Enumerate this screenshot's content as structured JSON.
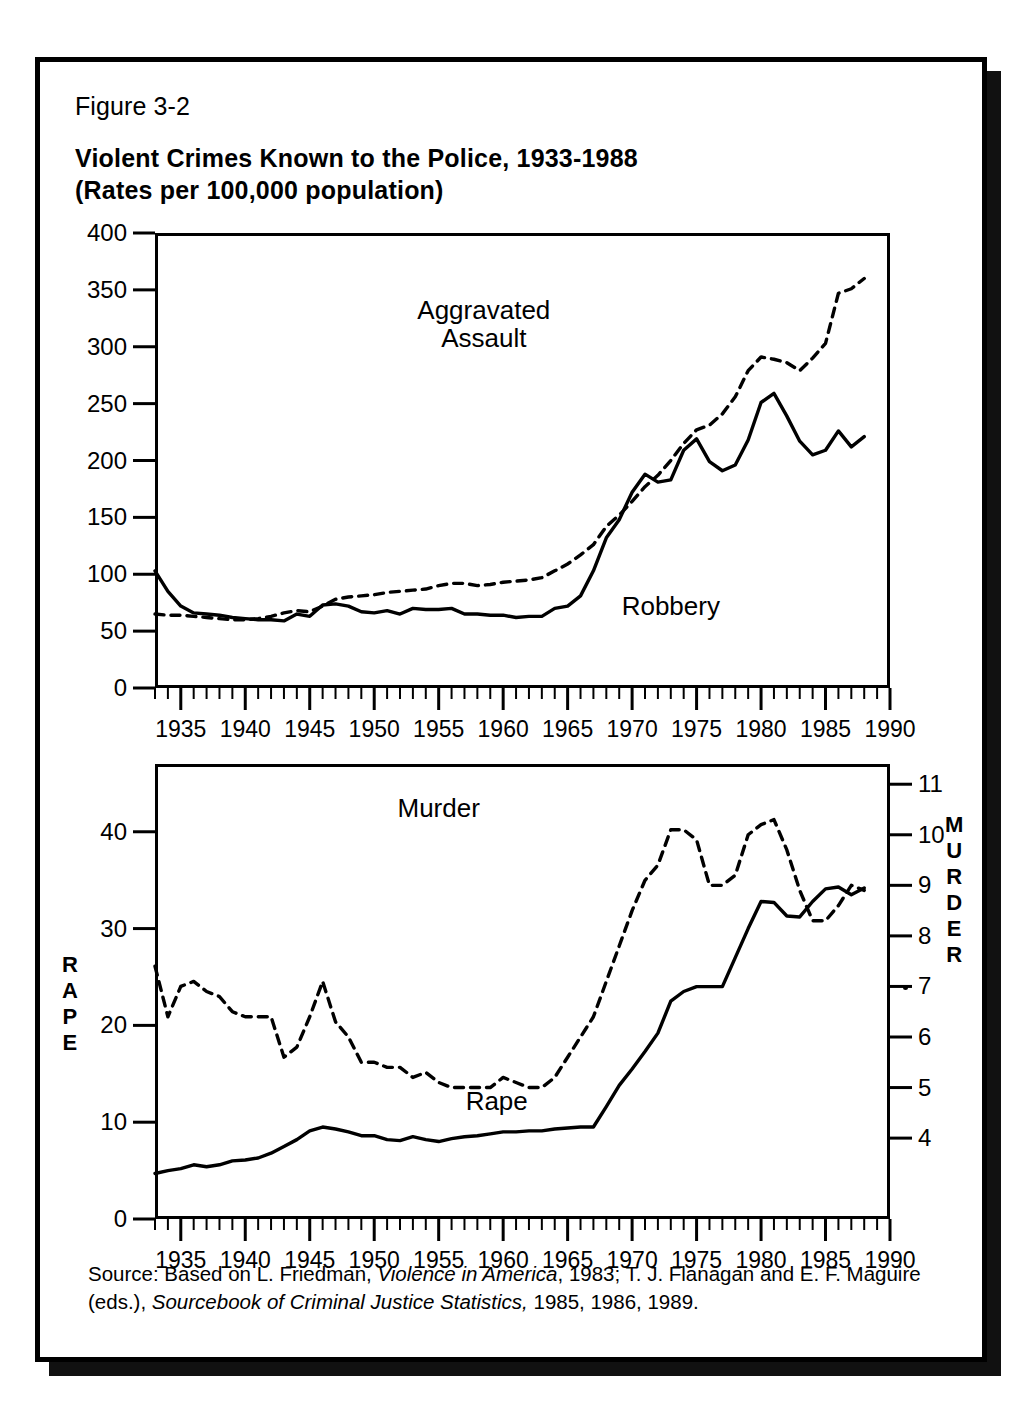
{
  "figure": {
    "number": "Figure 3-2",
    "title_line1": "Violent Crimes Known to the Police, 1933-1988",
    "title_line2": "(Rates per 100,000 population)",
    "source_prefix": "Source: Based on L. Friedman, ",
    "source_italic1": "Violence in America",
    "source_mid": ", 1983; T. J. Flanagan and E. F. Maguire (eds.), ",
    "source_italic2": "Sourcebook of Criminal Justice Statistics,",
    "source_suffix": " 1985, 1986, 1989."
  },
  "colors": {
    "ink": "#000000",
    "paper": "#ffffff",
    "shadow": "#111111"
  },
  "chart_data": [
    {
      "type": "line",
      "id": "upper",
      "title": "Violent Crimes Known to the Police, 1933-1988",
      "xlabel": "",
      "ylabel": "",
      "xlim": [
        1933,
        1990
      ],
      "ylim": [
        0,
        400
      ],
      "grid": false,
      "legend_position": "in-plot annotations",
      "yticks": [
        0,
        50,
        100,
        150,
        200,
        250,
        300,
        350,
        400
      ],
      "ytick_labels": [
        "0",
        "50",
        "100",
        "150",
        "200",
        "250",
        "300",
        "350",
        "400"
      ],
      "xticks": [
        1935,
        1940,
        1945,
        1950,
        1955,
        1960,
        1965,
        1970,
        1975,
        1980,
        1985,
        1990
      ],
      "xtick_labels": [
        "1935",
        "1940",
        "1945",
        "1950",
        "1955",
        "1960",
        "1965",
        "1970",
        "1975",
        "1980",
        "1985",
        "1990"
      ],
      "minor_xtick_step": 1,
      "annotations": [
        {
          "text": "Aggravated",
          "x": 1958.5,
          "y": 332
        },
        {
          "text": "Assault",
          "x": 1958.5,
          "y": 308
        },
        {
          "text": "Robbery",
          "x": 1973.0,
          "y": 72
        }
      ],
      "x": [
        1933,
        1934,
        1935,
        1936,
        1937,
        1938,
        1939,
        1940,
        1941,
        1942,
        1943,
        1944,
        1945,
        1946,
        1947,
        1948,
        1949,
        1950,
        1951,
        1952,
        1953,
        1954,
        1955,
        1956,
        1957,
        1958,
        1959,
        1960,
        1961,
        1962,
        1963,
        1964,
        1965,
        1966,
        1967,
        1968,
        1969,
        1970,
        1971,
        1972,
        1973,
        1974,
        1975,
        1976,
        1977,
        1978,
        1979,
        1980,
        1981,
        1982,
        1983,
        1984,
        1985,
        1986,
        1987,
        1988
      ],
      "series": [
        {
          "name": "Aggravated Assault",
          "style": "dashed",
          "values": [
            65,
            64,
            64,
            63,
            62,
            61,
            60,
            60,
            61,
            63,
            66,
            68,
            67,
            72,
            78,
            80,
            81,
            82,
            84,
            85,
            86,
            87,
            90,
            92,
            92,
            90,
            91,
            93,
            94,
            95,
            97,
            103,
            109,
            117,
            126,
            142,
            152,
            164,
            177,
            187,
            200,
            215,
            227,
            231,
            241,
            256,
            279,
            291,
            289,
            286,
            279,
            290,
            303,
            347,
            351,
            360
          ]
        },
        {
          "name": "Robbery",
          "style": "solid",
          "values": [
            103,
            85,
            72,
            66,
            65,
            64,
            62,
            61,
            60,
            60,
            59,
            65,
            63,
            73,
            74,
            72,
            67,
            66,
            68,
            65,
            70,
            69,
            69,
            70,
            65,
            65,
            64,
            64,
            62,
            63,
            63,
            70,
            72,
            81,
            103,
            132,
            148,
            172,
            188,
            181,
            183,
            209,
            219,
            199,
            191,
            196,
            218,
            251,
            259,
            239,
            217,
            205,
            209,
            226,
            212,
            221
          ]
        }
      ]
    },
    {
      "type": "line",
      "id": "lower",
      "title": "",
      "xlabel": "",
      "ylabel_left": "RAPE",
      "ylabel_right": "MURDER",
      "xlim": [
        1933,
        1990
      ],
      "ylim_left": [
        0,
        47
      ],
      "ylim_right": [
        2.4,
        11.4
      ],
      "grid": false,
      "legend_position": "in-plot annotations",
      "yticks_left": [
        0,
        10,
        20,
        30,
        40
      ],
      "ytick_labels_left": [
        "0",
        "10",
        "20",
        "30",
        "40"
      ],
      "yticks_right": [
        4,
        5,
        6,
        7,
        8,
        9,
        10,
        11
      ],
      "ytick_labels_right": [
        "4",
        "5",
        "6",
        "7",
        "8",
        "9",
        "10",
        "11"
      ],
      "xticks": [
        1935,
        1940,
        1945,
        1950,
        1955,
        1960,
        1965,
        1970,
        1975,
        1980,
        1985,
        1990
      ],
      "xtick_labels": [
        "1935",
        "1940",
        "1945",
        "1950",
        "1955",
        "1960",
        "1965",
        "1970",
        "1975",
        "1980",
        "1985",
        "1990"
      ],
      "minor_xtick_step": 1,
      "annotations": [
        {
          "text": "Murder",
          "x": 1955.0,
          "y_left": 42.5
        },
        {
          "text": "Rape",
          "x": 1959.5,
          "y_left": 12.2
        }
      ],
      "x": [
        1933,
        1934,
        1935,
        1936,
        1937,
        1938,
        1939,
        1940,
        1941,
        1942,
        1943,
        1944,
        1945,
        1946,
        1947,
        1948,
        1949,
        1950,
        1951,
        1952,
        1953,
        1954,
        1955,
        1956,
        1957,
        1958,
        1959,
        1960,
        1961,
        1962,
        1963,
        1964,
        1965,
        1966,
        1967,
        1968,
        1969,
        1970,
        1971,
        1972,
        1973,
        1974,
        1975,
        1976,
        1977,
        1978,
        1979,
        1980,
        1981,
        1982,
        1983,
        1984,
        1985,
        1986,
        1987,
        1988
      ],
      "series": [
        {
          "name": "Murder",
          "style": "dashed",
          "axis": "right",
          "values": [
            7.4,
            6.4,
            7.0,
            7.1,
            6.9,
            6.8,
            6.5,
            6.4,
            6.4,
            6.4,
            5.6,
            5.8,
            6.4,
            7.1,
            6.3,
            6.0,
            5.5,
            5.5,
            5.4,
            5.4,
            5.2,
            5.3,
            5.1,
            5.0,
            5.0,
            5.0,
            5.0,
            5.2,
            5.1,
            5.0,
            5.0,
            5.2,
            5.6,
            6.0,
            6.4,
            7.1,
            7.8,
            8.5,
            9.1,
            9.4,
            10.1,
            10.1,
            9.9,
            9.0,
            9.0,
            9.2,
            10.0,
            10.2,
            10.3,
            9.7,
            8.9,
            8.3,
            8.3,
            8.6,
            9.0,
            8.9
          ]
        },
        {
          "name": "Rape",
          "style": "solid",
          "axis": "left",
          "values": [
            4.7,
            5.0,
            5.2,
            5.6,
            5.4,
            5.6,
            6.0,
            6.1,
            6.3,
            6.8,
            7.5,
            8.2,
            9.1,
            9.5,
            9.3,
            9.0,
            8.6,
            8.6,
            8.2,
            8.1,
            8.5,
            8.2,
            8.0,
            8.3,
            8.5,
            8.6,
            8.8,
            9.0,
            9.0,
            9.1,
            9.1,
            9.3,
            9.4,
            9.5,
            9.5,
            11.6,
            13.8,
            15.5,
            17.3,
            19.2,
            22.5,
            23.5,
            24.0,
            24.0,
            24.0,
            27.0,
            30.0,
            32.8,
            32.7,
            31.3,
            31.2,
            32.8,
            34.1,
            34.3,
            33.5,
            34.2
          ]
        }
      ]
    }
  ]
}
